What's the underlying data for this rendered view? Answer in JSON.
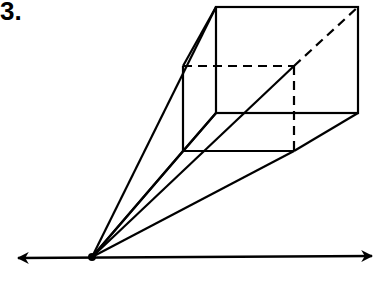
{
  "problem": {
    "number_label": "3."
  },
  "diagram": {
    "stroke_color": "#000000",
    "vanishing_point": {
      "x": 92,
      "y": 257
    },
    "horizon_line": {
      "x1": 18,
      "y1": 258,
      "x2": 372,
      "y2": 256
    },
    "front_face": {
      "x": 216,
      "y": 7,
      "w": 142,
      "h": 106
    },
    "back_face": {
      "x": 183,
      "y": 66,
      "w": 111,
      "h": 85
    }
  }
}
